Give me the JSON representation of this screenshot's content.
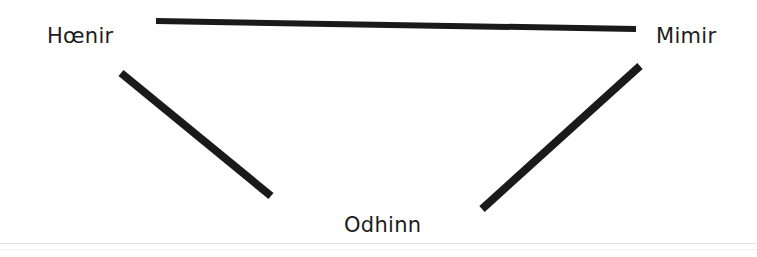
{
  "figure": {
    "background_color": "#ffffff",
    "stroke_color": "#1a1a1a",
    "text_color": "#201d1c",
    "width": 757,
    "height": 257
  },
  "nodes": [
    {
      "id": "hoenir",
      "label": "Hœnir",
      "position": "top-left"
    },
    {
      "id": "mimir",
      "label": "Mimir",
      "position": "top-right"
    },
    {
      "id": "odhinn",
      "label": "Odhinn",
      "position": "bottom-center"
    }
  ],
  "edges": [
    {
      "id": "edge-hoenir-mimir",
      "from": "hoenir",
      "to": "mimir",
      "x1": 156,
      "y1": 21,
      "x2": 636,
      "y2": 29,
      "thickness": 6
    },
    {
      "id": "edge-hoenir-odhinn",
      "from": "hoenir",
      "to": "odhinn",
      "x1": 121,
      "y1": 73,
      "x2": 271,
      "y2": 196,
      "thickness": 8
    },
    {
      "id": "edge-odhinn-mimir",
      "from": "odhinn",
      "to": "mimir",
      "x1": 482,
      "y1": 209,
      "x2": 640,
      "y2": 66,
      "thickness": 8
    }
  ],
  "scan_artifacts": {
    "lower_edge_color": "#e3e1df",
    "lowest_edge_color": "#f1f0ee"
  }
}
